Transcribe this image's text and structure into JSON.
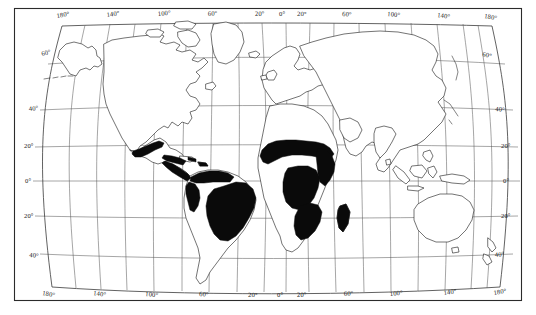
{
  "figure": {
    "type": "map",
    "projection": "curved pseudo-conic / Van der Grinten style world projection",
    "background_color": "#ffffff",
    "frame_color": "#2b2b2b",
    "graticule_color": "#5b5b5b",
    "coastline_color": "#1d1d1d",
    "shading_color": "#0a0a0a",
    "shading_meaning": "solid black fill marks the distribution / occurrence range"
  },
  "axes": {
    "top_labels": [
      {
        "text": "180°",
        "x": 66,
        "y": 16
      },
      {
        "text": "140°",
        "x": 114,
        "y": 15
      },
      {
        "text": "100°",
        "x": 166,
        "y": 14
      },
      {
        "text": "60°",
        "x": 214,
        "y": 14
      },
      {
        "text": "20°",
        "x": 260,
        "y": 14
      },
      {
        "text": "0°",
        "x": 283,
        "y": 14
      },
      {
        "text": "20°",
        "x": 302,
        "y": 14
      },
      {
        "text": "60°",
        "x": 344,
        "y": 14
      },
      {
        "text": "100°",
        "x": 392,
        "y": 14
      },
      {
        "text": "140°",
        "x": 442,
        "y": 15
      },
      {
        "text": "180°",
        "x": 490,
        "y": 16
      }
    ],
    "bottom_labels": [
      {
        "text": "180°",
        "x": 50,
        "y": 296
      },
      {
        "text": "140°",
        "x": 100,
        "y": 296
      },
      {
        "text": "100°",
        "x": 153,
        "y": 296
      },
      {
        "text": "60°",
        "x": 205,
        "y": 296
      },
      {
        "text": "20°",
        "x": 253,
        "y": 296
      },
      {
        "text": "0°",
        "x": 281,
        "y": 296
      },
      {
        "text": "20°",
        "x": 302,
        "y": 296
      },
      {
        "text": "60°",
        "x": 348,
        "y": 296
      },
      {
        "text": "100°",
        "x": 396,
        "y": 296
      },
      {
        "text": "140°",
        "x": 450,
        "y": 296
      },
      {
        "text": "180°",
        "x": 500,
        "y": 296
      }
    ],
    "left_labels": [
      {
        "text": "60°",
        "x": 45,
        "y": 54
      },
      {
        "text": "40°",
        "x": 30,
        "y": 110
      },
      {
        "text": "20°",
        "x": 24,
        "y": 147
      },
      {
        "text": "0°",
        "x": 24,
        "y": 182
      },
      {
        "text": "20°",
        "x": 24,
        "y": 217
      },
      {
        "text": "40°",
        "x": 30,
        "y": 256
      }
    ],
    "right_labels": [
      {
        "text": "60°",
        "x": 484,
        "y": 54
      },
      {
        "text": "40°",
        "x": 497,
        "y": 110
      },
      {
        "text": "20°",
        "x": 503,
        "y": 147
      },
      {
        "text": "0°",
        "x": 505,
        "y": 182
      },
      {
        "text": "20°",
        "x": 503,
        "y": 217
      },
      {
        "text": "40°",
        "x": 497,
        "y": 256
      }
    ],
    "longitude_range": [
      -180,
      180
    ],
    "longitude_step": 20,
    "latitude_labeled": [
      60,
      40,
      20,
      0,
      -20,
      -40
    ],
    "latitude_step": 20,
    "grid": true
  },
  "regions": {
    "shaded_areas": [
      "Mexico west coast",
      "Central America",
      "Caribbean coast of Venezuela / Colombia",
      "Pacific coast of Ecuador / Peru",
      "Brazil (eastern and central)",
      "West Africa / Sahel belt",
      "Central Africa",
      "East Africa",
      "Southern Africa (eastern)",
      "Madagascar"
    ],
    "unshaded_continents": [
      "North America (USA, Canada, Alaska, Greenland)",
      "Europe",
      "Asia",
      "Australia",
      "New Zealand",
      "North Africa (Sahara)",
      "Southern Argentina / Chile"
    ]
  }
}
